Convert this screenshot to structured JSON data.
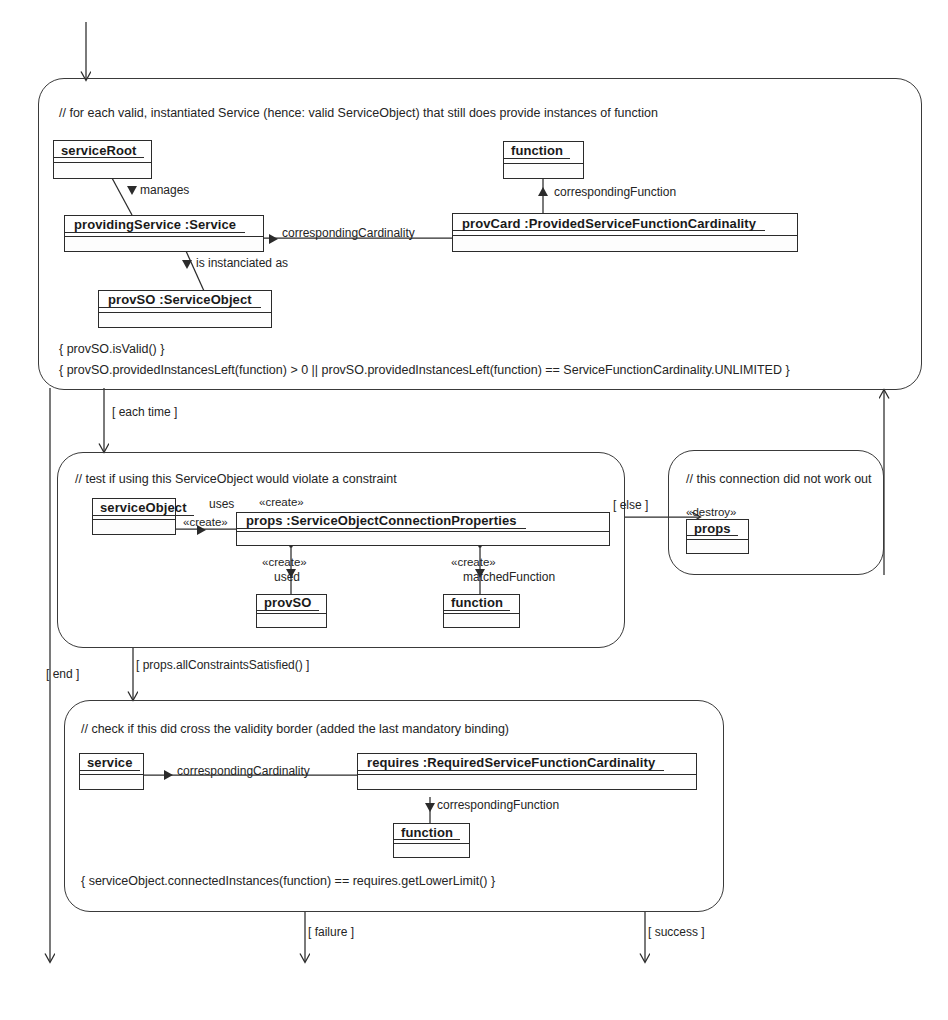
{
  "diagram": {
    "type": "UML activity diagram with object flow",
    "entry_arrow": "incoming control flow"
  },
  "activities": [
    {
      "id": "loop",
      "comment": "// for each valid, instantiated Service (hence: valid ServiceObject) that still does provide instances of function",
      "constraints": [
        "{ provSO.isValid() }",
        "{ provSO.providedInstancesLeft(function) > 0 || provSO.providedInstancesLeft(function) == ServiceFunctionCardinality.UNLIMITED }"
      ],
      "objects": [
        {
          "id": "serviceRoot",
          "label": "serviceRoot"
        },
        {
          "id": "function-top",
          "label": "function"
        },
        {
          "id": "providingService",
          "label": "providingService  :Service"
        },
        {
          "id": "provCard",
          "label": "provCard  :ProvidedServiceFunctionCardinality"
        },
        {
          "id": "provSO-top",
          "label": "provSO :ServiceObject"
        }
      ],
      "links": [
        {
          "id": "manages",
          "label": "manages"
        },
        {
          "id": "correspondingFunction-top",
          "label": "correspondingFunction"
        },
        {
          "id": "correspondingCardinality-top",
          "label": "correspondingCardinality"
        },
        {
          "id": "is-instanciated-as",
          "label": "is instanciated as"
        }
      ]
    },
    {
      "id": "test",
      "comment": "// test if using this ServiceObject would violate a constraint",
      "objects": [
        {
          "id": "serviceObject",
          "label": "serviceObject"
        },
        {
          "id": "props",
          "label": "props  :ServiceObjectConnectionProperties"
        },
        {
          "id": "provSO-mid",
          "label": "provSO"
        },
        {
          "id": "function-mid",
          "label": "function"
        }
      ],
      "links": [
        {
          "id": "uses",
          "label": "uses"
        },
        {
          "id": "create-uses",
          "label": "«create»"
        },
        {
          "id": "create-props",
          "label": "«create»"
        },
        {
          "id": "create-used",
          "label": "«create»"
        },
        {
          "id": "used",
          "label": "used"
        },
        {
          "id": "create-matched",
          "label": "«create»"
        },
        {
          "id": "matchedFunction",
          "label": "matchedFunction"
        }
      ]
    },
    {
      "id": "fail",
      "comment": "// this connection did not work out",
      "objects": [
        {
          "id": "props-destroy",
          "label": "props"
        }
      ],
      "stereotype": "«destroy»"
    },
    {
      "id": "check",
      "comment": "// check if this did cross the validity border (added the last mandatory binding)",
      "constraints": [
        "{ serviceObject.connectedInstances(function) == requires.getLowerLimit() }"
      ],
      "objects": [
        {
          "id": "service",
          "label": "service"
        },
        {
          "id": "requires",
          "label": "requires  :RequiredServiceFunctionCardinality"
        },
        {
          "id": "function-bottom",
          "label": "function"
        }
      ],
      "links": [
        {
          "id": "correspondingCardinality-bottom",
          "label": "correspondingCardinality"
        },
        {
          "id": "correspondingFunction-bottom",
          "label": "correspondingFunction"
        }
      ]
    }
  ],
  "guards": {
    "each_time": "[  each time  ]",
    "else": "[  else  ]",
    "end": "[  end  ]",
    "all_constraints_satisfied": "[  props.allConstraintsSatisfied()  ]",
    "failure": "[  failure  ]",
    "success": "[  success  ]"
  },
  "colors": {
    "line": "#2b2b2b",
    "frame": "#3a3a3a",
    "background": "#ffffff",
    "text": "#242424"
  }
}
